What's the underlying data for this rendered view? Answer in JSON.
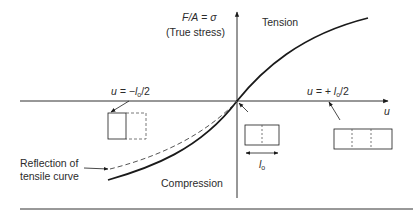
{
  "diagram": {
    "y_axis_label": "F/A = σ",
    "y_axis_label_parts": {
      "var": "F/A",
      "eq": " = ",
      "sym": "σ"
    },
    "y_axis_sublabel": "(True stress)",
    "x_axis_label": "u",
    "region_tension": "Tension",
    "region_compression": "Compression",
    "left_marker": {
      "prefix": "u = −",
      "l": "l",
      "sub": "o",
      "suffix": "/2"
    },
    "right_marker": {
      "prefix": "u = + ",
      "l": "l",
      "sub": "o",
      "suffix": "/2"
    },
    "reference_length": {
      "l": "l",
      "sub": "o"
    },
    "reflection_label_line1": "Reflection of",
    "reflection_label_line2": "tensile curve",
    "colors": {
      "line": "#1a1a1a",
      "text": "#2b2b2b",
      "dashed": "#555555"
    }
  }
}
